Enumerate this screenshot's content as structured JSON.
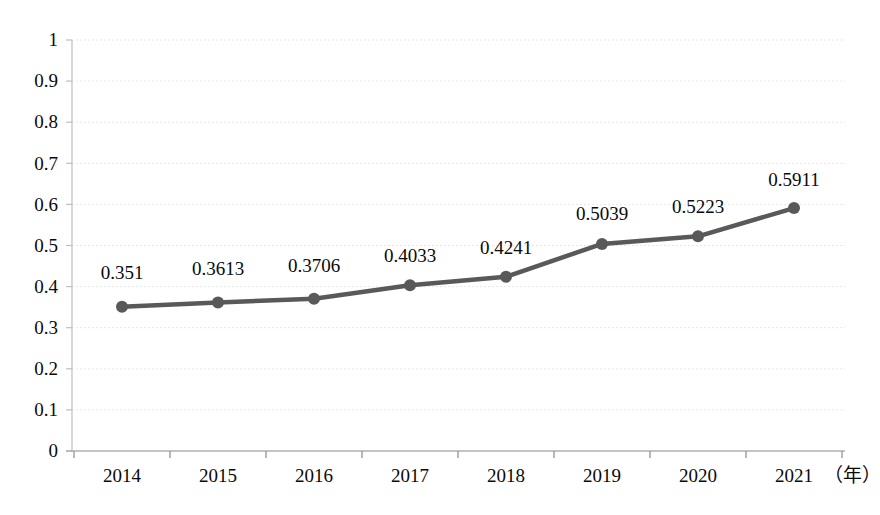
{
  "chart_data": {
    "type": "line",
    "title": "",
    "subtitle": "",
    "xlabel": "（年）",
    "ylabel": "",
    "categories": [
      "2014",
      "2015",
      "2016",
      "2017",
      "2018",
      "2019",
      "2020",
      "2021"
    ],
    "values": [
      0.351,
      0.3613,
      0.3706,
      0.4033,
      0.4241,
      0.5039,
      0.5223,
      0.5911
    ],
    "point_labels": [
      "0.351",
      "0.3613",
      "0.3706",
      "0.4033",
      "0.4241",
      "0.5039",
      "0.5223",
      "0.5911"
    ],
    "ylim": [
      0,
      1
    ],
    "ytick_values": [
      0,
      0.1,
      0.2,
      0.3,
      0.4,
      0.5,
      0.6,
      0.7,
      0.8,
      0.9,
      1
    ],
    "ytick_labels": [
      "0",
      "0.1",
      "0.2",
      "0.3",
      "0.4",
      "0.5",
      "0.6",
      "0.7",
      "0.8",
      "0.9",
      "1"
    ],
    "grid": true,
    "grid_orientation": "horizontal",
    "grid_style": "dotted",
    "legend": false,
    "legend_position": "none",
    "series": [
      {
        "name": "",
        "values": [
          0.351,
          0.3613,
          0.3706,
          0.4033,
          0.4241,
          0.5039,
          0.5223,
          0.5911
        ],
        "marker": "circle",
        "line_color": "#595959",
        "marker_color": "#595959"
      }
    ],
    "colors": {
      "line": "#595959",
      "marker": "#595959",
      "grid": "#e6e6e6",
      "axis": "#b3b3b3",
      "text": "#0a0a0a",
      "background": "#ffffff"
    }
  }
}
